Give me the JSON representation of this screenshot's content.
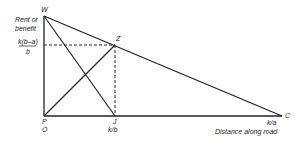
{
  "diagram": {
    "points": {
      "W": "W",
      "Z": "Z",
      "P": "P",
      "O": "O",
      "J": "J",
      "C": "C"
    },
    "y_axis_label_line1": "Rent or",
    "y_axis_label_line2": "benefit",
    "y_tick_numerator": "k(b–a)",
    "y_tick_denominator": "b",
    "x_tick_J": "k/b",
    "x_tick_C": "k/a",
    "x_axis_label": "Distance along road",
    "colors": {
      "line": "#222222",
      "background": "#ffffff"
    }
  }
}
